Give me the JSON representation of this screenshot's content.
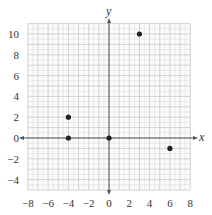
{
  "chart_data": {
    "type": "scatter",
    "title": "",
    "xlabel": "x",
    "ylabel": "y",
    "xlim": [
      -8,
      8
    ],
    "ylim": [
      -5,
      11
    ],
    "grid": true,
    "x_ticks": [
      -8,
      -6,
      -4,
      -2,
      0,
      2,
      4,
      6,
      8
    ],
    "y_ticks": [
      -4,
      -2,
      0,
      2,
      4,
      6,
      8,
      10
    ],
    "x_tick_labels": [
      "−8",
      "−6",
      "−4",
      "−2",
      "0",
      "2",
      "4",
      "6",
      "8"
    ],
    "y_tick_labels": [
      "−4",
      "−2",
      "0",
      "2",
      "4",
      "6",
      "8",
      "10"
    ],
    "points": [
      {
        "x": -4,
        "y": 2
      },
      {
        "x": -4,
        "y": 0
      },
      {
        "x": 0,
        "y": 0
      },
      {
        "x": 3,
        "y": 10
      },
      {
        "x": 6,
        "y": -1
      }
    ],
    "colors": {
      "grid": "#d9d9d9",
      "grid_major": "#c8c8c8",
      "axis": "#555555",
      "point": "#222222"
    }
  }
}
